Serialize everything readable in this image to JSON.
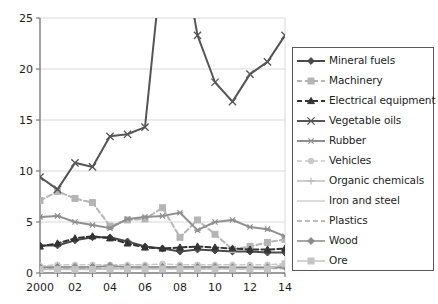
{
  "chart_data": {
    "type": "line",
    "title": "",
    "subtitle": "",
    "xlabel": "",
    "ylabel": "",
    "xlim": [
      2000,
      2014
    ],
    "ylim": [
      0,
      25
    ],
    "yticks": [
      0,
      5,
      10,
      15,
      20,
      25
    ],
    "ytick_labels": [
      "0",
      "5",
      "10",
      "15",
      "20",
      "25"
    ],
    "x": [
      2000,
      2001,
      2002,
      2003,
      2004,
      2005,
      2006,
      2007,
      2008,
      2009,
      2010,
      2011,
      2012,
      2013,
      2014
    ],
    "xtick_labels": [
      "2000",
      "",
      "02",
      "",
      "04",
      "",
      "06",
      "",
      "08",
      "",
      "10",
      "",
      "12",
      "",
      "14"
    ],
    "grid": "horizontal",
    "legend_position": "right",
    "clipped_note": "Mineral fuels exceeds the 25 axis maximum between 2006 and 2009",
    "series": [
      {
        "name": "Mineral fuels",
        "color": "#4a4a4a",
        "marker": "diamond",
        "dash": "solid",
        "width": 2,
        "values": [
          2.7,
          2.7,
          3.2,
          3.5,
          3.5,
          3.1,
          2.6,
          2.4,
          2.1,
          2.3,
          2.2,
          2.1,
          2.1,
          2.0,
          2.0
        ]
      },
      {
        "name": "Machinery",
        "color": "#b5b5b5",
        "marker": "square",
        "dash": "dashed",
        "width": 2,
        "values": [
          7.1,
          8.0,
          7.3,
          6.9,
          4.6,
          5.2,
          5.3,
          6.4,
          3.5,
          5.2,
          3.8,
          2.3,
          2.6,
          3.0,
          3.3
        ]
      },
      {
        "name": "Electrical equipment",
        "color": "#333333",
        "marker": "triangle",
        "dash": "dashed",
        "width": 2,
        "values": [
          2.6,
          2.9,
          3.4,
          3.6,
          3.4,
          2.9,
          2.5,
          2.4,
          2.5,
          2.6,
          2.5,
          2.4,
          2.3,
          2.3,
          2.4
        ]
      },
      {
        "name": "Vegetable oils",
        "color": "#555555",
        "marker": "x",
        "dash": "solid",
        "width": 2,
        "values": [
          9.4,
          8.2,
          10.8,
          10.4,
          13.4,
          13.6,
          14.3,
          31.0,
          33.0,
          23.3,
          18.7,
          16.8,
          19.5,
          20.7,
          23.3
        ]
      },
      {
        "name": "Rubber",
        "color": "#8f8f8f",
        "marker": "star",
        "dash": "solid",
        "width": 2,
        "values": [
          5.5,
          5.6,
          5.0,
          4.7,
          4.4,
          5.3,
          5.5,
          5.6,
          5.9,
          4.2,
          5.0,
          5.2,
          4.5,
          4.3,
          3.6
        ]
      },
      {
        "name": "Vehicles",
        "color": "#c9c9c9",
        "marker": "circle",
        "dash": "dashed",
        "width": 1.5,
        "values": [
          0.7,
          0.8,
          0.8,
          0.8,
          0.8,
          0.8,
          0.8,
          0.9,
          0.8,
          0.8,
          0.8,
          0.8,
          0.8,
          0.8,
          0.9
        ]
      },
      {
        "name": "Organic chemicals",
        "color": "#bdbdbd",
        "marker": "plus",
        "dash": "solid",
        "width": 1.5,
        "values": [
          0.6,
          0.6,
          0.6,
          0.6,
          0.6,
          0.6,
          0.6,
          0.6,
          0.6,
          0.6,
          0.6,
          0.6,
          0.6,
          0.6,
          0.6
        ]
      },
      {
        "name": "Iron and steel",
        "color": "#d0d0d0",
        "marker": "none",
        "dash": "solid",
        "width": 1.5,
        "values": [
          0.5,
          0.5,
          0.5,
          0.5,
          0.5,
          0.5,
          0.5,
          0.5,
          0.5,
          0.5,
          0.5,
          0.5,
          0.5,
          0.5,
          0.5
        ]
      },
      {
        "name": "Plastics",
        "color": "#a8a8a8",
        "marker": "none",
        "dash": "dashed",
        "width": 1.5,
        "values": [
          0.45,
          0.45,
          0.45,
          0.45,
          0.45,
          0.45,
          0.45,
          0.45,
          0.45,
          0.45,
          0.45,
          0.45,
          0.45,
          0.45,
          0.45
        ]
      },
      {
        "name": "Wood",
        "color": "#8a8a8a",
        "marker": "diamond",
        "dash": "solid",
        "width": 1.5,
        "values": [
          0.55,
          0.6,
          0.6,
          0.6,
          0.7,
          0.6,
          0.6,
          0.6,
          0.6,
          0.6,
          0.6,
          0.55,
          0.55,
          0.55,
          0.6
        ]
      },
      {
        "name": "Ore",
        "color": "#c4c4c4",
        "marker": "square",
        "dash": "solid",
        "width": 1.5,
        "values": [
          0.35,
          0.35,
          0.35,
          0.35,
          0.4,
          0.4,
          0.4,
          0.4,
          0.4,
          0.4,
          0.4,
          0.4,
          0.4,
          0.4,
          0.9
        ]
      }
    ]
  }
}
